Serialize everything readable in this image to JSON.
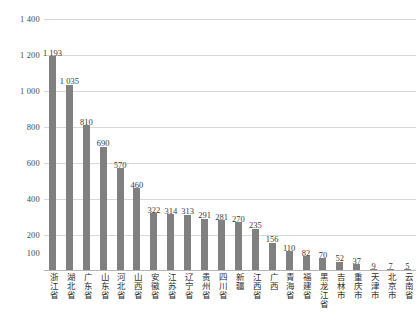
{
  "chart_data": {
    "type": "bar",
    "title": "",
    "xlabel": "",
    "ylabel": "",
    "ylim": [
      0,
      1400
    ],
    "grid": true,
    "legend": "none",
    "bar_color": "#808080",
    "gridline_color": "#d9d9d9",
    "y_ticks": [
      "1 400",
      "1 200",
      "1 000",
      "800",
      "600",
      "400",
      "200",
      "100"
    ],
    "y_tick_values": [
      1400,
      1200,
      1000,
      800,
      600,
      400,
      200,
      100
    ],
    "categories": [
      "浙江省",
      "湖北省",
      "广东省",
      "山东省",
      "河北省",
      "山西省",
      "安徽省",
      "江苏省",
      "辽宁省",
      "贵州省",
      "四川省",
      "新疆",
      "江西省",
      "广西",
      "青海省",
      "福建省",
      "黑龙江省",
      "吉林市",
      "重庆市",
      "天津市",
      "北京市",
      "云南省"
    ],
    "values": [
      1193,
      1035,
      810,
      690,
      570,
      460,
      322,
      314,
      313,
      291,
      281,
      270,
      235,
      156,
      110,
      82,
      70,
      52,
      37,
      9,
      7,
      5
    ],
    "value_labels": [
      "1 193",
      "1 035",
      "810",
      "690",
      "570",
      "460",
      "322",
      "314",
      "313",
      "291",
      "281",
      "270",
      "235",
      "156",
      "110",
      "82",
      "70",
      "52",
      "37",
      "9",
      "7",
      "5"
    ]
  }
}
